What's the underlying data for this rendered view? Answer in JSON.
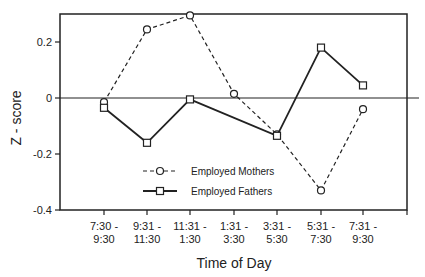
{
  "chart_data": {
    "type": "line",
    "title": "",
    "xlabel": "Time of Day",
    "ylabel": "Z - score",
    "ylim": [
      -0.4,
      0.3
    ],
    "yticks": [
      "0.2",
      "0",
      "-0.2",
      "-0.4"
    ],
    "categories": [
      [
        "7:30 -",
        "9:30"
      ],
      [
        "9:31 -",
        "11:30"
      ],
      [
        "11:31 -",
        "1:30"
      ],
      [
        "1:31 -",
        "3:30"
      ],
      [
        "3:31 -",
        "5:30"
      ],
      [
        "5:31 -",
        "7:30"
      ],
      [
        "7:31 -",
        "9:30"
      ]
    ],
    "series": [
      {
        "name": "Employed Mothers",
        "style": "dashed",
        "marker": "circle",
        "values": [
          -0.015,
          0.245,
          0.295,
          0.015,
          -0.13,
          -0.33,
          -0.04
        ]
      },
      {
        "name": "Employed Fathers",
        "style": "solid",
        "marker": "square",
        "values": [
          -0.035,
          -0.16,
          -0.005,
          null,
          -0.135,
          0.18,
          0.045
        ]
      }
    ],
    "grid": false,
    "zero_line": true,
    "legend_position": "lower-left-inside"
  }
}
